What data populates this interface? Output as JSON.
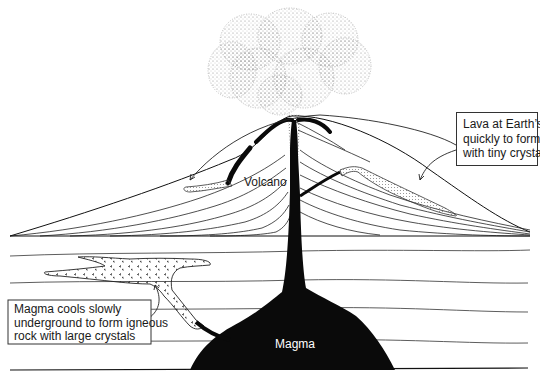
{
  "diagram": {
    "type": "cross-section",
    "labels": {
      "volcano": "Volcano",
      "magma": "Magma"
    },
    "callouts": {
      "lava": {
        "lines": [
          "Lava at Earth’s surface cools",
          "quickly to form igneous rock",
          "with tiny crystals"
        ]
      },
      "magma": {
        "lines": [
          "Magma cools slowly",
          "underground to form igneous",
          "rock with large crystals"
        ]
      }
    },
    "colors": {
      "ink": "#111111",
      "background": "#ffffff",
      "magma_fill": "#0a0a0a",
      "ash_stipple": "#8a8a8a"
    }
  }
}
